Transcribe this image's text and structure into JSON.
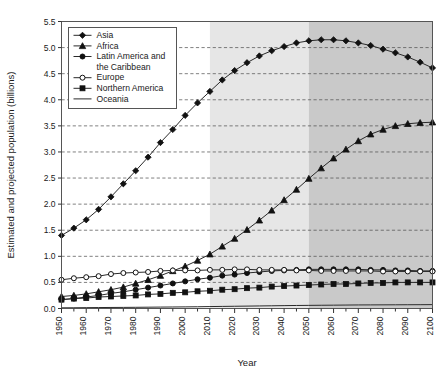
{
  "chart_data": {
    "type": "line",
    "title": "",
    "xlabel": "Year",
    "ylabel": "Estimated and projected population (billions)",
    "xlim": [
      1950,
      2100
    ],
    "ylim": [
      0.0,
      5.5
    ],
    "ytick_step": 0.5,
    "xtick_step": 10,
    "grid": "horizontal-dashed",
    "legend_position": "top-left-inside",
    "x": [
      1950,
      1955,
      1960,
      1965,
      1970,
      1975,
      1980,
      1985,
      1990,
      1995,
      2000,
      2005,
      2010,
      2015,
      2020,
      2025,
      2030,
      2035,
      2040,
      2045,
      2050,
      2055,
      2060,
      2065,
      2070,
      2075,
      2080,
      2085,
      2090,
      2095,
      2100
    ],
    "xticks": [
      "1950",
      "1960",
      "1970",
      "1980",
      "1990",
      "2000",
      "2010",
      "2020",
      "2030",
      "2040",
      "2050",
      "2060",
      "2070",
      "2080",
      "2090",
      "2100"
    ],
    "yticks": [
      "0.0",
      "0.5",
      "1.0",
      "1.5",
      "2.0",
      "2.5",
      "3.0",
      "3.5",
      "4.0",
      "4.5",
      "5.0",
      "5.5"
    ],
    "shaded_regions": [
      {
        "name": "estimate-projection-band",
        "from": 2010,
        "to": 2050,
        "color": "#e6e6e6"
      },
      {
        "name": "long-range-projection-band",
        "from": 2050,
        "to": 2100,
        "color": "#c9c9c9"
      }
    ],
    "series": [
      {
        "name": "Asia",
        "marker": "diamond",
        "fill": "solid",
        "color": "#1a1a1a",
        "values": [
          1.4,
          1.54,
          1.7,
          1.9,
          2.14,
          2.39,
          2.64,
          2.9,
          3.18,
          3.43,
          3.7,
          3.94,
          4.16,
          4.38,
          4.56,
          4.71,
          4.84,
          4.94,
          5.02,
          5.09,
          5.13,
          5.15,
          5.15,
          5.13,
          5.09,
          5.04,
          4.97,
          4.9,
          4.82,
          4.72,
          4.61
        ]
      },
      {
        "name": "Africa",
        "marker": "triangle",
        "fill": "solid",
        "color": "#1a1a1a",
        "values": [
          0.23,
          0.25,
          0.28,
          0.32,
          0.36,
          0.41,
          0.48,
          0.55,
          0.63,
          0.72,
          0.81,
          0.92,
          1.04,
          1.19,
          1.34,
          1.51,
          1.69,
          1.88,
          2.08,
          2.28,
          2.49,
          2.69,
          2.88,
          3.05,
          3.21,
          3.34,
          3.43,
          3.5,
          3.54,
          3.56,
          3.57
        ]
      },
      {
        "name": "Latin America and the Caribbean",
        "marker": "circle",
        "fill": "solid",
        "color": "#1a1a1a",
        "values": [
          0.17,
          0.19,
          0.22,
          0.25,
          0.29,
          0.32,
          0.36,
          0.4,
          0.44,
          0.48,
          0.52,
          0.56,
          0.59,
          0.63,
          0.65,
          0.68,
          0.7,
          0.72,
          0.73,
          0.74,
          0.75,
          0.75,
          0.75,
          0.75,
          0.75,
          0.74,
          0.74,
          0.73,
          0.73,
          0.72,
          0.72
        ]
      },
      {
        "name": "Europe",
        "marker": "circle",
        "fill": "open",
        "color": "#1a1a1a",
        "values": [
          0.55,
          0.58,
          0.6,
          0.62,
          0.66,
          0.68,
          0.69,
          0.7,
          0.72,
          0.73,
          0.73,
          0.73,
          0.74,
          0.74,
          0.75,
          0.75,
          0.74,
          0.74,
          0.74,
          0.73,
          0.73,
          0.72,
          0.72,
          0.72,
          0.72,
          0.72,
          0.71,
          0.71,
          0.71,
          0.71,
          0.71
        ]
      },
      {
        "name": "Northern America",
        "marker": "square",
        "fill": "solid",
        "color": "#1a1a1a",
        "values": [
          0.17,
          0.19,
          0.2,
          0.22,
          0.23,
          0.24,
          0.25,
          0.27,
          0.28,
          0.3,
          0.31,
          0.33,
          0.34,
          0.36,
          0.37,
          0.39,
          0.4,
          0.42,
          0.43,
          0.44,
          0.45,
          0.46,
          0.47,
          0.47,
          0.48,
          0.49,
          0.49,
          0.5,
          0.5,
          0.5,
          0.5
        ]
      },
      {
        "name": "Oceania",
        "marker": "none",
        "fill": "line",
        "color": "#1a1a1a",
        "values": [
          0.013,
          0.014,
          0.016,
          0.018,
          0.02,
          0.021,
          0.023,
          0.025,
          0.027,
          0.029,
          0.031,
          0.033,
          0.037,
          0.04,
          0.043,
          0.046,
          0.049,
          0.052,
          0.055,
          0.058,
          0.06,
          0.062,
          0.064,
          0.066,
          0.068,
          0.069,
          0.07,
          0.071,
          0.072,
          0.073,
          0.074
        ]
      }
    ]
  },
  "legend": {
    "entries": [
      {
        "label": "Asia"
      },
      {
        "label": "Africa"
      },
      {
        "label": "Latin America and"
      },
      {
        "label": "the Caribbean"
      },
      {
        "label": "Europe"
      },
      {
        "label": "Northern America"
      },
      {
        "label": "Oceania"
      }
    ]
  }
}
